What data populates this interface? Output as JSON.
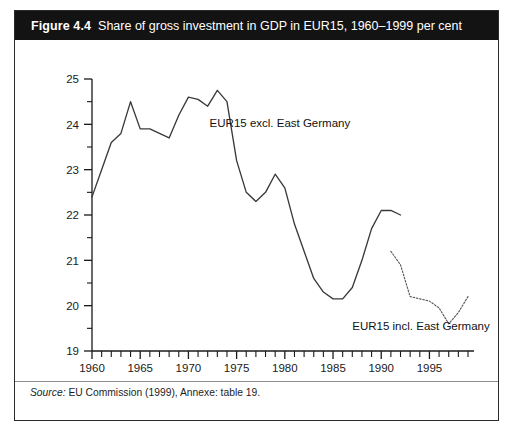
{
  "figure": {
    "number": "Figure 4.4",
    "title": "Share of gross investment in GDP in EUR15, 1960–1999 per cent",
    "source_label": "Source:",
    "source_text": "EU Commission (1999), Annexe: table 19."
  },
  "colors": {
    "banner_background": "#131313",
    "banner_text": "#ffffff",
    "page_background": "#ffffff",
    "frame_border": "#2b2b2b",
    "axis": "#1a1a1a",
    "line_primary": "#3a3a3a",
    "line_secondary": "#5a5a5a"
  },
  "chart_data": {
    "type": "line",
    "title": "Share of gross investment in GDP in EUR15, 1960–1999 per cent",
    "xlabel": "",
    "ylabel": "",
    "xlim": [
      1960,
      1999
    ],
    "ylim": [
      19,
      25
    ],
    "grid": false,
    "legend_position": "inline-annotation",
    "y_ticks": [
      19,
      20,
      21,
      22,
      23,
      24,
      25
    ],
    "y_tick_labels": [
      "19",
      "20",
      "21",
      "22",
      "23",
      "24",
      "25"
    ],
    "y_minor_ticks": [
      19.5,
      20.5,
      21.5,
      22.5,
      23.5,
      24.5
    ],
    "x_ticks": [
      1960,
      1961,
      1962,
      1963,
      1964,
      1965,
      1966,
      1967,
      1968,
      1969,
      1970,
      1971,
      1972,
      1973,
      1974,
      1975,
      1976,
      1977,
      1978,
      1979,
      1980,
      1981,
      1982,
      1983,
      1984,
      1985,
      1986,
      1987,
      1988,
      1989,
      1990,
      1991,
      1992,
      1993,
      1994,
      1995,
      1996,
      1997,
      1998,
      1999
    ],
    "x_tick_labels_shown": [
      "1960",
      "1965",
      "1970",
      "1975",
      "1980",
      "1985",
      "1990",
      "1995"
    ],
    "x_labeled_ticks": [
      1960,
      1965,
      1970,
      1975,
      1980,
      1985,
      1990,
      1995
    ],
    "series": [
      {
        "name": "EUR15 excl. East Germany",
        "style": "solid",
        "annotation": "EUR15 excl. East Germany",
        "x": [
          1960,
          1961,
          1962,
          1963,
          1964,
          1965,
          1966,
          1967,
          1968,
          1969,
          1970,
          1971,
          1972,
          1973,
          1974,
          1975,
          1976,
          1977,
          1978,
          1979,
          1980,
          1981,
          1982,
          1983,
          1984,
          1985,
          1986,
          1987,
          1988,
          1989,
          1990,
          1991,
          1992
        ],
        "values": [
          22.4,
          23.0,
          23.6,
          23.8,
          24.5,
          23.9,
          23.9,
          23.8,
          23.7,
          24.2,
          24.6,
          24.55,
          24.4,
          24.75,
          24.5,
          23.2,
          22.5,
          22.3,
          22.5,
          22.9,
          22.6,
          21.8,
          21.2,
          20.6,
          20.3,
          20.15,
          20.15,
          20.4,
          21.0,
          21.7,
          22.1,
          22.1,
          22.0
        ]
      },
      {
        "name": "EUR15 incl. East Germany",
        "style": "dotted",
        "annotation": "EUR15 incl. East Germany",
        "x": [
          1991,
          1992,
          1993,
          1994,
          1995,
          1996,
          1997,
          1998,
          1999
        ],
        "values": [
          21.2,
          20.9,
          20.2,
          20.15,
          20.1,
          19.95,
          19.6,
          19.85,
          20.2
        ]
      }
    ],
    "annotations": [
      {
        "text": "EUR15 excl. East Germany",
        "x": 1972.2,
        "y": 23.95
      },
      {
        "text": "EUR15 incl. East Germany",
        "x": 1987.0,
        "y": 19.47
      }
    ]
  }
}
